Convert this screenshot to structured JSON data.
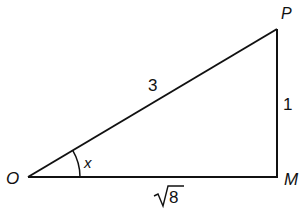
{
  "diagram": {
    "type": "right-triangle",
    "stroke_color": "#111111",
    "background_color": "#ffffff",
    "vertices": {
      "O": {
        "label": "O",
        "x": 28,
        "y": 177
      },
      "P": {
        "label": "P",
        "x": 277,
        "y": 29
      },
      "M": {
        "label": "M",
        "x": 277,
        "y": 177
      }
    },
    "sides": {
      "OP": {
        "label": "3",
        "description": "hypotenuse"
      },
      "PM": {
        "label": "1",
        "description": "vertical leg"
      },
      "OM": {
        "label": "√8",
        "radicand": "8",
        "description": "base"
      }
    },
    "angle": {
      "vertex": "O",
      "label": "x"
    }
  }
}
